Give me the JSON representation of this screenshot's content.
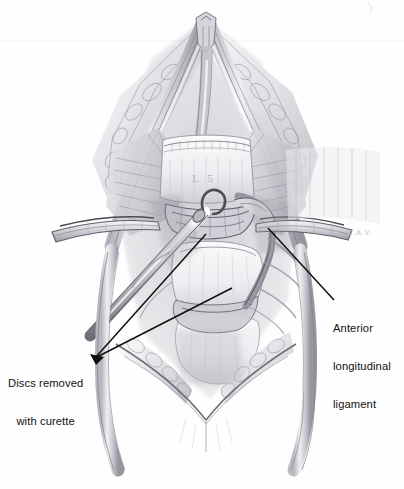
{
  "figure": {
    "kind": "medical-illustration",
    "technique": "graphite pencil drawing",
    "background_color": "#fefefe",
    "ink_color": "#111111",
    "pencil_dark": "#5d5d62",
    "pencil_mid": "#8f8f96",
    "pencil_light": "#c9c9cf",
    "pencil_pale": "#e6e6ea"
  },
  "labels": {
    "discs": {
      "line1": "Discs removed",
      "line2": "with curette",
      "leader_target_1": "disc space upper",
      "leader_target_2": "disc space lower"
    },
    "ligament": {
      "line1": "Anterior",
      "line2": "longitudinal",
      "line3": "ligament",
      "leader_target": "anterior longitudinal ligament flap"
    }
  },
  "annotations_in_art": {
    "vertebral_body_label": "L 5",
    "artist_signature": "C.A.V."
  },
  "anatomy": {
    "structures": [
      "common iliac artery left",
      "common iliac artery right",
      "common iliac vein",
      "aortic bifurcation",
      "retroperitoneal fat",
      "L5 vertebral body",
      "sacral promontory",
      "L5-S1 intervertebral disc space",
      "anterior longitudinal ligament",
      "psoas muscle",
      "retractor blade left",
      "retractor blade right",
      "curette instrument"
    ]
  }
}
